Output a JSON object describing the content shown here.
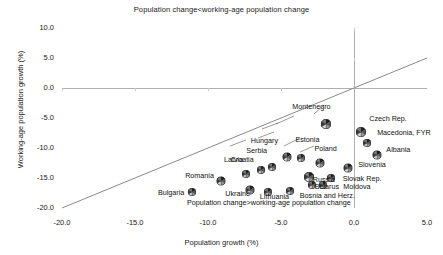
{
  "chart_data": {
    "type": "scatter",
    "title": "Population change<working-age population change",
    "xlabel": "Population growth (%)",
    "ylabel": "Working-age population growth (%)",
    "xlim": [
      -20.0,
      5.0
    ],
    "ylim": [
      -20.0,
      10.0
    ],
    "xticks": [
      "-20.0",
      "-15.0",
      "-10.0",
      "-5.0",
      "0.0",
      "5.0"
    ],
    "yticks": [
      "10.0",
      "5.0",
      "0.0",
      "-5.0",
      "-10.0",
      "-15.0",
      "-20.0"
    ],
    "grid": false,
    "legend": "none",
    "marker_style": "pie-glyph",
    "reference_lines": [
      {
        "name": "y-zero",
        "type": "horizontal",
        "value": 0.0
      },
      {
        "name": "x-zero",
        "type": "vertical",
        "value": 0.0
      },
      {
        "name": "identity",
        "type": "diagonal",
        "slope": 1.0,
        "intercept": 0.0
      }
    ],
    "annotations": [
      {
        "name": "above-line-note",
        "text": "Population change<working-age population change"
      },
      {
        "name": "below-line-note",
        "text": "Population change>working-age population change"
      }
    ],
    "points": [
      {
        "label": "Montenegro",
        "x": -1.9,
        "y": -5.4,
        "size": 10
      },
      {
        "label": "Czech Rep.",
        "x": 0.5,
        "y": -6.6,
        "size": 10
      },
      {
        "label": "Macedonia, FYR",
        "x": 0.9,
        "y": -8.1,
        "size": 8
      },
      {
        "label": "Albania",
        "x": 1.6,
        "y": -10.3,
        "size": 9
      },
      {
        "label": "Hungary",
        "x": -4.6,
        "y": -10.6,
        "size": 9
      },
      {
        "label": "Estonia",
        "x": -3.6,
        "y": -10.6,
        "size": 8
      },
      {
        "label": "Poland",
        "x": -2.3,
        "y": -11.6,
        "size": 9
      },
      {
        "label": "Serbia",
        "x": -5.6,
        "y": -12.1,
        "size": 8
      },
      {
        "label": "Croatia",
        "x": -6.4,
        "y": -12.6,
        "size": 8
      },
      {
        "label": "Slovenia",
        "x": -0.4,
        "y": -12.5,
        "size": 9
      },
      {
        "label": "Latvia",
        "x": -7.4,
        "y": -13.4,
        "size": 8
      },
      {
        "label": "Russia",
        "x": -3.1,
        "y": -14.1,
        "size": 10
      },
      {
        "label": "Slovak Rep.",
        "x": -1.6,
        "y": -14.0,
        "size": 8
      },
      {
        "label": "Belarus",
        "x": -2.9,
        "y": -15.1,
        "size": 8
      },
      {
        "label": "Moldova",
        "x": -2.1,
        "y": -15.2,
        "size": 8
      },
      {
        "label": "Romania",
        "x": -9.1,
        "y": -14.6,
        "size": 9
      },
      {
        "label": "Ukraine",
        "x": -7.1,
        "y": -16.1,
        "size": 9
      },
      {
        "label": "Lithuania",
        "x": -5.9,
        "y": -16.3,
        "size": 8
      },
      {
        "label": "Bosnia and Herz.",
        "x": -4.4,
        "y": -16.1,
        "size": 8
      },
      {
        "label": "Bulgaria",
        "x": -11.1,
        "y": -16.4,
        "size": 8
      }
    ]
  }
}
